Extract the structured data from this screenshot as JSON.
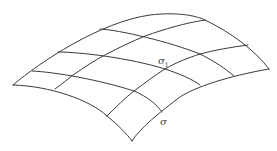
{
  "diagram": {
    "type": "curved-surface-mesh",
    "stroke_color": "#3a3a3a",
    "background": "#ffffff",
    "labels": {
      "sigma1": {
        "base": "σ",
        "sub": "1",
        "x": 158,
        "y": 56
      },
      "sigma": {
        "base": "σ",
        "x": 160,
        "y": 117
      }
    },
    "outline": {
      "top_left_edge": "M13,85 C40,62 100,22 150,15 C175,12 195,15 205,20",
      "top_right_edge": "M205,20 C230,32 255,50 269,69",
      "bottom_right_edge": "M269,69 C240,74 200,84 180,97 C160,112 140,128 132,141",
      "bottom_left_edge": "M13,85 C50,86 90,100 107,116 C118,125 127,134 132,141"
    },
    "grid_lines_u": [
      "M32,71 C55,72 100,80 134,91 C148,97 156,104 162,112",
      "M58,52 C80,52 130,58 165,69 C180,74 192,79 200,85",
      "M100,29 C120,30 170,42 200,54 C214,61 226,69 234,76"
    ],
    "grid_lines_v": [
      "M55,89 C62,84 68,79 73,75 C85,67 95,60 105,55 C120,47 133,41 145,36 C165,29 185,23 205,20",
      "M107,116 C116,107 125,98 134,91 C145,83 155,75 165,69 C177,62 188,58 200,54 C215,50 232,47 248,45"
    ]
  }
}
